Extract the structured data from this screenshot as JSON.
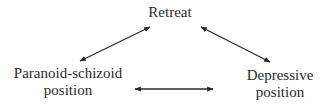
{
  "diagram": {
    "type": "triangle-cycle",
    "nodes": [
      {
        "id": "retreat",
        "lines": [
          "Retreat"
        ]
      },
      {
        "id": "paranoid_schizoid",
        "lines": [
          "Paranoid-schizoid",
          "position"
        ]
      },
      {
        "id": "depressive",
        "lines": [
          "Depressive",
          "position"
        ]
      }
    ],
    "edges": [
      {
        "from": "retreat",
        "to": "paranoid_schizoid",
        "direction": "bidirectional"
      },
      {
        "from": "retreat",
        "to": "depressive",
        "direction": "bidirectional"
      },
      {
        "from": "paranoid_schizoid",
        "to": "depressive",
        "direction": "bidirectional"
      }
    ],
    "colors": {
      "text": "#2a2a2a",
      "arrow": "#2a2a2a",
      "background": "#ffffff"
    }
  }
}
